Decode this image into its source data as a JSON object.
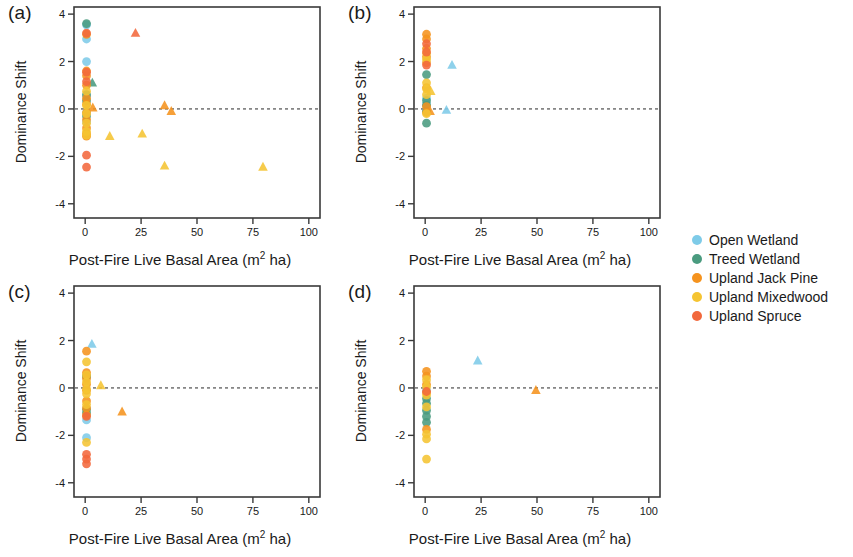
{
  "figure": {
    "panel_count": 4,
    "axis_label_x": "Post-Fire Live Basal Area (m",
    "axis_label_x_sup": "2",
    "axis_label_x_tail": " ha)",
    "axis_label_y": "Dominance Shift"
  },
  "legend": {
    "position": "right",
    "entries": [
      {
        "label": "Open Wetland",
        "color": "#7ecbe8"
      },
      {
        "label": "Treed Wetland",
        "color": "#4a9b7f"
      },
      {
        "label": "Upland Jack Pine",
        "color": "#f5931e"
      },
      {
        "label": "Upland Mixedwood",
        "color": "#f5c432"
      },
      {
        "label": "Upland Spruce",
        "color": "#f2683c"
      }
    ]
  },
  "chart_data": [
    {
      "type": "scatter",
      "panel": "(a)",
      "title": "Jack Pine",
      "xlabel": "Post-Fire Live Basal Area (m2 ha)",
      "ylabel": "Dominance Shift",
      "xlim": [
        -5,
        105
      ],
      "ylim": [
        -4.6,
        4.3
      ],
      "xticks": [
        0,
        25,
        50,
        75,
        100
      ],
      "yticks": [
        -4,
        -2,
        0,
        2,
        4
      ],
      "grid": false,
      "reference_line_y": 0,
      "series": [
        {
          "name": "Open Wetland",
          "color": "#7ecbe8",
          "points": [
            {
              "x": 0.6,
              "y": 3.55,
              "m": "circle"
            },
            {
              "x": 0.6,
              "y": 2.95,
              "m": "circle"
            },
            {
              "x": 0.6,
              "y": 2.0,
              "m": "circle"
            },
            {
              "x": 0.6,
              "y": 0.55,
              "m": "circle"
            },
            {
              "x": 0.6,
              "y": -0.15,
              "m": "circle"
            },
            {
              "x": 0.6,
              "y": -0.55,
              "m": "circle"
            }
          ]
        },
        {
          "name": "Treed Wetland",
          "color": "#4a9b7f",
          "points": [
            {
              "x": 0.6,
              "y": 3.6,
              "m": "circle"
            },
            {
              "x": 0.6,
              "y": 0.6,
              "m": "circle"
            },
            {
              "x": 0.6,
              "y": 0.35,
              "m": "circle"
            },
            {
              "x": 3.2,
              "y": 1.1,
              "m": "triangle"
            },
            {
              "x": 0.6,
              "y": -0.3,
              "m": "circle"
            }
          ]
        },
        {
          "name": "Upland Jack Pine",
          "color": "#f5931e",
          "points": [
            {
              "x": 0.6,
              "y": 3.15,
              "m": "circle"
            },
            {
              "x": 0.6,
              "y": 1.6,
              "m": "circle"
            },
            {
              "x": 0.6,
              "y": 1.4,
              "m": "circle"
            },
            {
              "x": 0.6,
              "y": 1.0,
              "m": "circle"
            },
            {
              "x": 0.6,
              "y": 0.45,
              "m": "circle"
            },
            {
              "x": 0.6,
              "y": 0.2,
              "m": "circle"
            },
            {
              "x": 0.6,
              "y": -0.15,
              "m": "circle"
            },
            {
              "x": 0.6,
              "y": -0.45,
              "m": "circle"
            },
            {
              "x": 0.6,
              "y": -0.8,
              "m": "circle"
            },
            {
              "x": 0.6,
              "y": -1.05,
              "m": "circle"
            },
            {
              "x": 0.6,
              "y": -1.15,
              "m": "circle"
            },
            {
              "x": 3.4,
              "y": 0.05,
              "m": "triangle"
            },
            {
              "x": 35.5,
              "y": 0.15,
              "m": "triangle"
            },
            {
              "x": 38.5,
              "y": -0.1,
              "m": "triangle"
            }
          ]
        },
        {
          "name": "Upland Mixedwood",
          "color": "#f5c432",
          "points": [
            {
              "x": 0.6,
              "y": 0.75,
              "m": "circle"
            },
            {
              "x": 0.6,
              "y": 0.15,
              "m": "circle"
            },
            {
              "x": 0.6,
              "y": -0.2,
              "m": "circle"
            },
            {
              "x": 0.6,
              "y": -0.6,
              "m": "circle"
            },
            {
              "x": 0.6,
              "y": -0.95,
              "m": "circle"
            },
            {
              "x": 0.6,
              "y": -1.1,
              "m": "circle"
            },
            {
              "x": 11.0,
              "y": -1.15,
              "m": "triangle"
            },
            {
              "x": 25.5,
              "y": -1.05,
              "m": "triangle"
            },
            {
              "x": 35.5,
              "y": -2.4,
              "m": "triangle"
            },
            {
              "x": 79.5,
              "y": -2.45,
              "m": "triangle"
            }
          ]
        },
        {
          "name": "Upland Spruce",
          "color": "#f2683c",
          "points": [
            {
              "x": 0.6,
              "y": 3.2,
              "m": "circle"
            },
            {
              "x": 0.6,
              "y": 1.55,
              "m": "circle"
            },
            {
              "x": 0.6,
              "y": 1.15,
              "m": "circle"
            },
            {
              "x": 0.6,
              "y": -1.95,
              "m": "circle"
            },
            {
              "x": 0.6,
              "y": -2.45,
              "m": "circle"
            },
            {
              "x": 22.5,
              "y": 3.2,
              "m": "triangle"
            }
          ]
        }
      ]
    },
    {
      "type": "scatter",
      "panel": "(b)",
      "title": "Trembling Aspen",
      "xlabel": "Post-Fire Live Basal Area (m2 ha)",
      "ylabel": "Dominance Shift",
      "xlim": [
        -5,
        105
      ],
      "ylim": [
        -4.6,
        4.3
      ],
      "xticks": [
        0,
        25,
        50,
        75,
        100
      ],
      "yticks": [
        -4,
        -2,
        0,
        2,
        4
      ],
      "grid": false,
      "reference_line_y": 0,
      "series": [
        {
          "name": "Open Wetland",
          "color": "#7ecbe8",
          "points": [
            {
              "x": 12.0,
              "y": 1.85,
              "m": "triangle"
            },
            {
              "x": 0.6,
              "y": 0.45,
              "m": "circle"
            },
            {
              "x": 0.6,
              "y": 0.2,
              "m": "circle"
            },
            {
              "x": 9.5,
              "y": -0.05,
              "m": "triangle"
            },
            {
              "x": 0.6,
              "y": -0.1,
              "m": "circle"
            }
          ]
        },
        {
          "name": "Treed Wetland",
          "color": "#4a9b7f",
          "points": [
            {
              "x": 0.6,
              "y": 1.45,
              "m": "circle"
            },
            {
              "x": 0.6,
              "y": 0.35,
              "m": "circle"
            },
            {
              "x": 0.6,
              "y": 0.15,
              "m": "circle"
            },
            {
              "x": 0.6,
              "y": -0.1,
              "m": "circle"
            },
            {
              "x": 0.6,
              "y": -0.6,
              "m": "circle"
            }
          ]
        },
        {
          "name": "Upland Jack Pine",
          "color": "#f5931e",
          "points": [
            {
              "x": 0.6,
              "y": 3.15,
              "m": "circle"
            },
            {
              "x": 0.6,
              "y": 2.95,
              "m": "circle"
            },
            {
              "x": 0.6,
              "y": 2.55,
              "m": "circle"
            },
            {
              "x": 0.6,
              "y": 2.2,
              "m": "circle"
            },
            {
              "x": 0.6,
              "y": 1.95,
              "m": "circle"
            },
            {
              "x": 0.6,
              "y": 0.9,
              "m": "circle"
            },
            {
              "x": 0.6,
              "y": 0.1,
              "m": "circle"
            },
            {
              "x": 2.2,
              "y": -0.1,
              "m": "triangle"
            },
            {
              "x": 0.6,
              "y": -0.15,
              "m": "circle"
            }
          ]
        },
        {
          "name": "Upland Mixedwood",
          "color": "#f5c432",
          "points": [
            {
              "x": 0.6,
              "y": 2.35,
              "m": "circle"
            },
            {
              "x": 0.6,
              "y": 2.1,
              "m": "circle"
            },
            {
              "x": 0.6,
              "y": 1.1,
              "m": "circle"
            },
            {
              "x": 0.6,
              "y": 0.85,
              "m": "circle"
            },
            {
              "x": 2.5,
              "y": 0.75,
              "m": "triangle"
            },
            {
              "x": 0.6,
              "y": 0.6,
              "m": "circle"
            },
            {
              "x": 0.6,
              "y": -0.2,
              "m": "circle"
            }
          ]
        },
        {
          "name": "Upland Spruce",
          "color": "#f2683c",
          "points": [
            {
              "x": 0.6,
              "y": 2.75,
              "m": "circle"
            },
            {
              "x": 0.6,
              "y": 2.4,
              "m": "circle"
            },
            {
              "x": 0.6,
              "y": 1.85,
              "m": "circle"
            }
          ]
        }
      ]
    },
    {
      "type": "scatter",
      "panel": "(c)",
      "title": "Black Spruce",
      "xlabel": "Post-Fire Live Basal Area (m2 ha)",
      "ylabel": "Dominance Shift",
      "xlim": [
        -5,
        105
      ],
      "ylim": [
        -4.6,
        4.3
      ],
      "xticks": [
        0,
        25,
        50,
        75,
        100
      ],
      "yticks": [
        -4,
        -2,
        0,
        2,
        4
      ],
      "grid": false,
      "reference_line_y": 0,
      "series": [
        {
          "name": "Open Wetland",
          "color": "#7ecbe8",
          "points": [
            {
              "x": 3.0,
              "y": 1.85,
              "m": "triangle"
            },
            {
              "x": 0.6,
              "y": 0.45,
              "m": "circle"
            },
            {
              "x": 0.6,
              "y": -1.35,
              "m": "circle"
            },
            {
              "x": 0.6,
              "y": -2.1,
              "m": "circle"
            }
          ]
        },
        {
          "name": "Treed Wetland",
          "color": "#4a9b7f",
          "points": [
            {
              "x": 0.6,
              "y": 0.5,
              "m": "circle"
            },
            {
              "x": 0.6,
              "y": -0.9,
              "m": "circle"
            },
            {
              "x": 0.6,
              "y": -1.05,
              "m": "circle"
            }
          ]
        },
        {
          "name": "Upland Jack Pine",
          "color": "#f5931e",
          "points": [
            {
              "x": 0.6,
              "y": 1.55,
              "m": "circle"
            },
            {
              "x": 0.6,
              "y": 0.65,
              "m": "circle"
            },
            {
              "x": 0.6,
              "y": 0.4,
              "m": "circle"
            },
            {
              "x": 0.6,
              "y": 0.15,
              "m": "circle"
            },
            {
              "x": 0.6,
              "y": -0.1,
              "m": "circle"
            },
            {
              "x": 0.6,
              "y": -0.55,
              "m": "circle"
            },
            {
              "x": 0.6,
              "y": -0.85,
              "m": "circle"
            },
            {
              "x": 0.6,
              "y": -1.15,
              "m": "circle"
            },
            {
              "x": 16.5,
              "y": -1.0,
              "m": "triangle"
            }
          ]
        },
        {
          "name": "Upland Mixedwood",
          "color": "#f5c432",
          "points": [
            {
              "x": 0.6,
              "y": 1.1,
              "m": "circle"
            },
            {
              "x": 0.6,
              "y": 0.55,
              "m": "circle"
            },
            {
              "x": 0.6,
              "y": 0.25,
              "m": "circle"
            },
            {
              "x": 0.6,
              "y": -0.05,
              "m": "circle"
            },
            {
              "x": 0.6,
              "y": -0.25,
              "m": "circle"
            },
            {
              "x": 0.6,
              "y": -0.7,
              "m": "circle"
            },
            {
              "x": 0.6,
              "y": -2.3,
              "m": "circle"
            },
            {
              "x": 7.0,
              "y": 0.1,
              "m": "triangle"
            }
          ]
        },
        {
          "name": "Upland Spruce",
          "color": "#f2683c",
          "points": [
            {
              "x": 0.6,
              "y": -1.2,
              "m": "circle"
            },
            {
              "x": 0.6,
              "y": -2.8,
              "m": "circle"
            },
            {
              "x": 0.6,
              "y": -3.0,
              "m": "circle"
            },
            {
              "x": 0.6,
              "y": -3.2,
              "m": "circle"
            }
          ]
        }
      ]
    },
    {
      "type": "scatter",
      "panel": "(d)",
      "title": "White Spruce",
      "xlabel": "Post-Fire Live Basal Area (m2 ha)",
      "ylabel": "Dominance Shift",
      "xlim": [
        -5,
        105
      ],
      "ylim": [
        -4.6,
        4.3
      ],
      "xticks": [
        0,
        25,
        50,
        75,
        100
      ],
      "yticks": [
        -4,
        -2,
        0,
        2,
        4
      ],
      "grid": false,
      "reference_line_y": 0,
      "series": [
        {
          "name": "Open Wetland",
          "color": "#7ecbe8",
          "points": [
            {
              "x": 23.5,
              "y": 1.15,
              "m": "triangle"
            },
            {
              "x": 0.6,
              "y": -0.1,
              "m": "circle"
            }
          ]
        },
        {
          "name": "Treed Wetland",
          "color": "#4a9b7f",
          "points": [
            {
              "x": 0.6,
              "y": -0.45,
              "m": "circle"
            },
            {
              "x": 0.6,
              "y": -0.65,
              "m": "circle"
            },
            {
              "x": 0.6,
              "y": -0.95,
              "m": "circle"
            },
            {
              "x": 0.6,
              "y": -1.2,
              "m": "circle"
            },
            {
              "x": 0.6,
              "y": -1.45,
              "m": "circle"
            }
          ]
        },
        {
          "name": "Upland Jack Pine",
          "color": "#f5931e",
          "points": [
            {
              "x": 0.6,
              "y": 0.7,
              "m": "circle"
            },
            {
              "x": 0.6,
              "y": 0.5,
              "m": "circle"
            },
            {
              "x": 0.6,
              "y": 0.15,
              "m": "circle"
            },
            {
              "x": 0.6,
              "y": -0.2,
              "m": "circle"
            },
            {
              "x": 0.6,
              "y": -1.75,
              "m": "circle"
            },
            {
              "x": 49.5,
              "y": -0.1,
              "m": "triangle"
            }
          ]
        },
        {
          "name": "Upland Mixedwood",
          "color": "#f5c432",
          "points": [
            {
              "x": 0.6,
              "y": 0.35,
              "m": "circle"
            },
            {
              "x": 0.6,
              "y": 0.05,
              "m": "circle"
            },
            {
              "x": 0.6,
              "y": -0.3,
              "m": "circle"
            },
            {
              "x": 0.6,
              "y": -0.8,
              "m": "circle"
            },
            {
              "x": 0.6,
              "y": -1.95,
              "m": "circle"
            },
            {
              "x": 0.6,
              "y": -2.15,
              "m": "circle"
            },
            {
              "x": 0.6,
              "y": -3.0,
              "m": "circle"
            }
          ]
        },
        {
          "name": "Upland Spruce",
          "color": "#f2683c",
          "points": [
            {
              "x": 0.6,
              "y": -0.15,
              "m": "circle"
            }
          ]
        }
      ]
    }
  ]
}
